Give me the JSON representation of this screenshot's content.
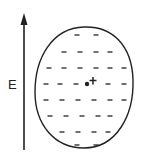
{
  "diagram": {
    "field_label": "E",
    "charge_center_symbol": "+",
    "minus_symbol": "−",
    "colors": {
      "stroke": "#222222",
      "background": "#ffffff"
    },
    "minus_rows": [
      [
        77,
        96
      ],
      [
        64,
        80,
        96,
        110
      ],
      [
        49,
        64,
        80,
        96,
        110,
        124
      ],
      [
        46,
        60,
        76,
        108,
        124
      ],
      [
        46,
        62,
        78,
        94,
        110,
        124
      ],
      [
        50,
        66,
        82,
        98,
        110
      ],
      [
        62,
        78,
        94,
        108
      ],
      [
        77,
        96
      ]
    ],
    "row_y": [
      35,
      52,
      68,
      84,
      100,
      116,
      132,
      145
    ]
  }
}
